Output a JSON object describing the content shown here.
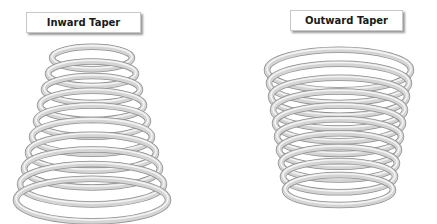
{
  "labels": {
    "inward": "Inward Taper",
    "outward": "Outward Taper"
  },
  "springs": {
    "inward": {
      "coils": 10,
      "top_radius": 40,
      "bottom_radius": 76,
      "cx": 92,
      "top_y": 58,
      "bottom_y": 200
    },
    "outward": {
      "coils": 10,
      "top_radius": 72,
      "bottom_radius": 54,
      "cx": 339,
      "top_y": 70,
      "bottom_y": 190
    }
  },
  "colors": {
    "wire": "#d4d4d4",
    "wire_shadow": "#8f8f8f",
    "wire_highlight": "#f4f4f4"
  }
}
